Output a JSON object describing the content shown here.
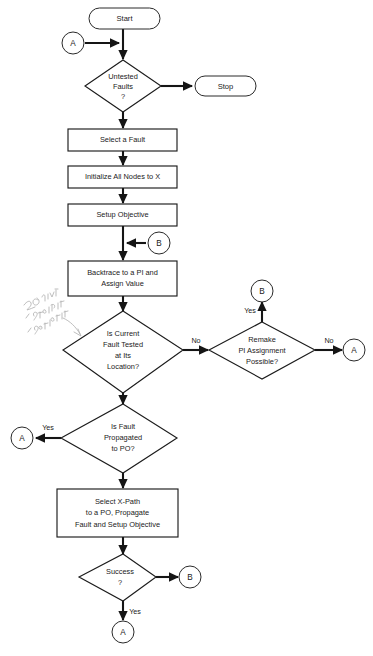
{
  "diagram": {
    "background": "#ffffff",
    "line_color": "#151515",
    "text_color": "#1a1a1a"
  },
  "nodes": {
    "start": {
      "label": "Start",
      "type": "terminator"
    },
    "stop": {
      "label": "Stop",
      "type": "terminator"
    },
    "untested_faults": {
      "label_line1": "Untested",
      "label_line2": "Faults",
      "label_line3": "?",
      "type": "decision"
    },
    "select_fault": {
      "label": "Select a Fault",
      "type": "process"
    },
    "initialize_nodes": {
      "label": "Initialize All Nodes to X",
      "type": "process"
    },
    "setup_objective": {
      "label": "Setup Objective",
      "type": "process"
    },
    "backtrace": {
      "label_line1": "Backtrace to a PI and",
      "label_line2": "Assign Value",
      "type": "process"
    },
    "fault_tested": {
      "label_line1": "Is Current",
      "label_line2": "Fault Tested",
      "label_line3": "at Its",
      "label_line4": "Location?",
      "type": "decision"
    },
    "remake_pi": {
      "label_line1": "Remake",
      "label_line2": "PI Assignment",
      "label_line3": "Possible?",
      "type": "decision"
    },
    "fault_propagated": {
      "label_line1": "Is Fault",
      "label_line2": "Propagated",
      "label_line3": "to PO?",
      "type": "decision"
    },
    "select_xpath": {
      "label_line1": "Select X-Path",
      "label_line2": "to a PO, Propagate",
      "label_line3": "Fault and Setup Objective",
      "type": "process"
    },
    "success": {
      "label_line1": "Success",
      "label_line2": "?",
      "type": "decision"
    }
  },
  "connectors": {
    "a_top": {
      "label": "A"
    },
    "b_mid": {
      "label": "B"
    },
    "b_upper_right": {
      "label": "B"
    },
    "a_right": {
      "label": "A"
    },
    "a_left": {
      "label": "A"
    },
    "b_bottom_right": {
      "label": "B"
    },
    "a_bottom": {
      "label": "A"
    }
  },
  "edge_labels": {
    "untested_to_stop": "",
    "fault_tested_no": "No",
    "remake_pi_yes": "Yes",
    "remake_pi_no": "No",
    "fault_propagated_yes": "Yes",
    "success_yes": "Yes"
  },
  "annotation": {
    "handwritten_note": "2 ways: 1 fault 1 no-fault"
  }
}
